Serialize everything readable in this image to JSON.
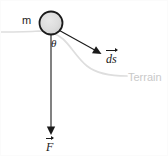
{
  "diagram": {
    "canvas": {
      "width": 168,
      "height": 156,
      "background": "#ffffff"
    },
    "labels": {
      "mass": "m",
      "angle": "θ",
      "terrain": "Terrain",
      "displacement_vector": "ds",
      "force_vector": "F"
    },
    "colors": {
      "stroke": "#1a1a1a",
      "ball_fill": "#dcdcdc",
      "ball_stroke": "#1a1a1a",
      "terrain": "#dcdcdc",
      "terrain_label": "#c9c9c9",
      "background": "#ffffff"
    },
    "elements": {
      "ball": {
        "cx": 50,
        "cy": 22,
        "r": 12,
        "name": "mass-ball"
      },
      "force_arrow": {
        "x1": 50,
        "y1": 34,
        "x2": 50,
        "y2": 133,
        "name": "force-arrow"
      },
      "ds_arrow": {
        "x1": 58,
        "y1": 30,
        "x2": 100,
        "y2": 53,
        "name": "ds-arrow"
      },
      "terrain_curve": {
        "name": "terrain-curve"
      }
    }
  }
}
